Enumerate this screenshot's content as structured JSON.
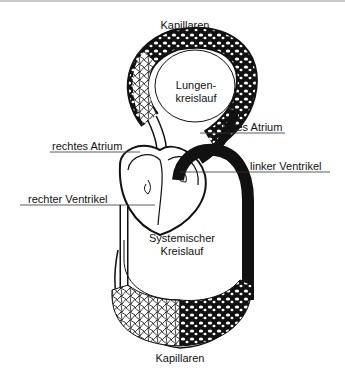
{
  "diagram": {
    "labels": {
      "capillaries_top": "Kapillaren",
      "pulmonary_circuit_line1": "Lungen-",
      "pulmonary_circuit_line2": "kreislauf",
      "left_atrium": "linkes Atrium",
      "right_atrium": "rechtes Atrium",
      "left_ventricle": "linker Ventrikel",
      "right_ventricle": "rechter Ventrikel",
      "systemic_circuit_line1": "Systemischer",
      "systemic_circuit_line2": "Kreislauf",
      "capillaries_bottom": "Kapillaren"
    },
    "colors": {
      "oxygenated": "#0a0a0a",
      "deoxygenated": "#ffffff",
      "outline": "#111111",
      "leader_line": "#333333"
    }
  }
}
